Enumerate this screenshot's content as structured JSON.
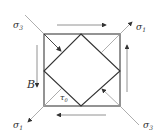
{
  "diagram": {
    "labels": {
      "sigma3_top_left": "σ",
      "sigma3_top_left_sub": "3",
      "sigma1_top_right": "σ",
      "sigma1_top_right_sub": "1",
      "sigma1_bottom_left": "σ",
      "sigma1_bottom_left_sub": "1",
      "sigma3_bottom_right": "σ",
      "sigma3_bottom_right_sub": "3",
      "point_B": "B",
      "tau": "τ",
      "tau_sub": "0"
    },
    "colors": {
      "square": "#666666",
      "diamond": "#333333",
      "arrows": "#555555",
      "thin_lines": "#999999"
    }
  }
}
